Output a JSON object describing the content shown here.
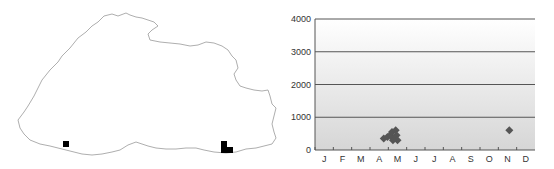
{
  "map": {
    "title": "",
    "records": [
      {
        "x": 66,
        "y": 144
      },
      {
        "x": 224,
        "y": 144
      },
      {
        "x": 224,
        "y": 150
      },
      {
        "x": 230,
        "y": 150
      }
    ],
    "marker_color": "#000000",
    "outline_color": "#999999"
  },
  "chart_data": {
    "type": "scatter",
    "title": "",
    "xlabel": "",
    "ylabel": "",
    "categories": [
      "J",
      "F",
      "M",
      "A",
      "M",
      "J",
      "J",
      "A",
      "S",
      "O",
      "N",
      "D"
    ],
    "yticks": [
      0,
      1000,
      2000,
      3000,
      4000
    ],
    "ylim": [
      0,
      4000
    ],
    "grid": true,
    "series": [
      {
        "name": "records",
        "marker": "diamond",
        "color": "#555555",
        "points": [
          {
            "month": 3.75,
            "value": 350
          },
          {
            "month": 3.95,
            "value": 400
          },
          {
            "month": 4.1,
            "value": 450
          },
          {
            "month": 4.2,
            "value": 550
          },
          {
            "month": 4.3,
            "value": 350
          },
          {
            "month": 4.4,
            "value": 600
          },
          {
            "month": 4.45,
            "value": 450
          },
          {
            "month": 4.5,
            "value": 300
          },
          {
            "month": 4.25,
            "value": 300
          },
          {
            "month": 10.6,
            "value": 600
          }
        ]
      }
    ]
  }
}
